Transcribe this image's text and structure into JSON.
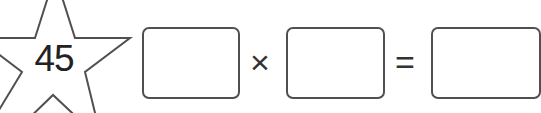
{
  "puzzle": {
    "star_number": "45",
    "operators": {
      "multiply": "×",
      "equals": "="
    },
    "boxes": [
      {
        "value": ""
      },
      {
        "value": ""
      },
      {
        "value": ""
      }
    ]
  },
  "colors": {
    "stroke": "#505050",
    "text": "#222222",
    "background": "#ffffff"
  }
}
